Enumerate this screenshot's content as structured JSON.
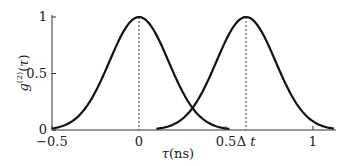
{
  "chart_data": {
    "type": "line",
    "title": "",
    "xlabel": "τ(ns)",
    "ylabel": "g(2)(τ)",
    "xlim": [
      -0.5,
      1.12
    ],
    "ylim": [
      0,
      1
    ],
    "x_ticks": [
      {
        "value": -0.5,
        "label": "−0.5"
      },
      {
        "value": 0,
        "label": "0"
      },
      {
        "value": 0.5,
        "label": "0.5"
      },
      {
        "value": 0.615,
        "label": "Δt"
      },
      {
        "value": 1,
        "label": "1"
      }
    ],
    "y_ticks": [
      {
        "value": 0,
        "label": "0"
      },
      {
        "value": 0.5,
        "label": "0.5"
      },
      {
        "value": 1,
        "label": "1"
      }
    ],
    "series": [
      {
        "name": "peak at 0",
        "shape": "gaussian",
        "center": 0,
        "peak": 1,
        "sigma": 0.17,
        "x_range": [
          -0.5,
          0.52
        ]
      },
      {
        "name": "peak at Δt",
        "shape": "gaussian",
        "center": 0.615,
        "peak": 1,
        "sigma": 0.17,
        "x_range": [
          0.1,
          1.12
        ]
      }
    ],
    "annotations": [
      {
        "type": "dotted-vline",
        "x": 0
      },
      {
        "type": "dotted-vline",
        "x": 0.615
      }
    ],
    "grid": false,
    "legend": null
  }
}
